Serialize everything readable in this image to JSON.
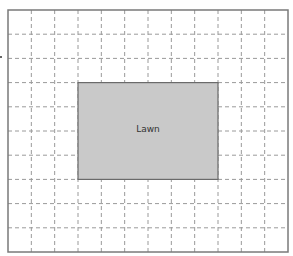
{
  "diagram": {
    "type": "grid-plan",
    "grid": {
      "columns": 12,
      "rows": 10,
      "x": 8,
      "y": 10,
      "width": 280,
      "height": 242,
      "border_color": "#7a7a7a",
      "line_color": "#9a9a9a",
      "background": "#ffffff"
    },
    "regions": [
      {
        "label": "Lawn",
        "col_start": 3,
        "col_end": 9,
        "row_start": 3,
        "row_end": 7,
        "fill": "#c9c9c9",
        "stroke": "#6a6a6a"
      }
    ]
  }
}
